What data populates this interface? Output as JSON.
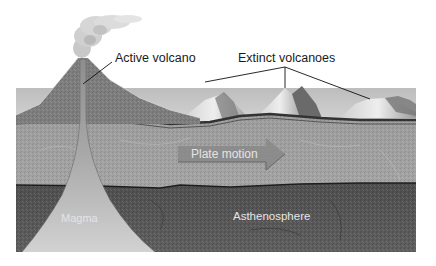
{
  "diagram": {
    "labels": {
      "active_volcano": "Active volcano",
      "extinct_volcanoes": "Extinct volcanoes",
      "plate_motion": "Plate motion",
      "magma": "Magma",
      "asthenosphere": "Asthenosphere"
    },
    "colors": {
      "background": "#ffffff",
      "sky": "#c9c9c9",
      "crust": "#9a9a9a",
      "volcano_cone": "#7d7d7d",
      "asthenosphere": "#555555",
      "magma": "#bdbdbd",
      "boundary_line": "#222222",
      "plate_arrow": "#8a8a8a",
      "extinct_peak_light": "#e6e6e6",
      "extinct_peak_dark": "#6a6a6a",
      "smoke": "#d4d4d4",
      "text_dark": "#1a1a1a",
      "text_light": "#e4e4e4"
    }
  }
}
